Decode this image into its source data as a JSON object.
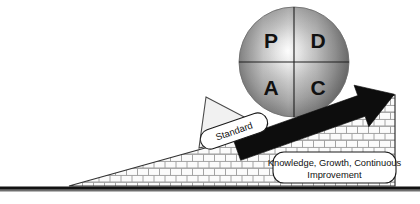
{
  "diagram": {
    "sphere": {
      "name": "pdca-wheel",
      "quadrants": [
        {
          "key": "plan",
          "label": "P"
        },
        {
          "key": "do",
          "label": "D"
        },
        {
          "key": "act",
          "label": "A"
        },
        {
          "key": "check",
          "label": "C"
        }
      ]
    },
    "wedge": {
      "name": "standard-chock",
      "label": "Standard"
    },
    "arrow": {
      "name": "improvement-arrow",
      "direction": "up-right"
    },
    "ramp": {
      "name": "brick-ramp",
      "texture": "brick"
    },
    "callout": {
      "name": "outcome-callout",
      "line1": "Knowledge, Growth, Continuous",
      "line2": "Improvement"
    },
    "ground": {
      "name": "ground-line"
    }
  },
  "colors": {
    "sphere_light": "#f3f3f3",
    "sphere_mid": "#a8a8a8",
    "sphere_dark": "#585858",
    "arrow_fill": "#0d0d0d",
    "brick_fill": "#fbfbfb",
    "brick_mortar": "#9a9a9a",
    "outline": "#1a1a1a",
    "wedge_fill": "#f2f2f2",
    "callout_fill": "#ffffff",
    "ground": "#111111",
    "background": "#ffffff"
  }
}
